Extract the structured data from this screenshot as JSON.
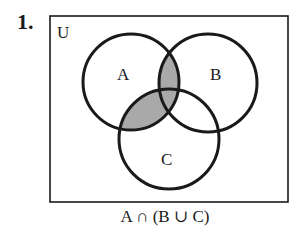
{
  "problem": {
    "number": "1."
  },
  "diagram": {
    "universe_label": "U",
    "sets": [
      {
        "label": "A",
        "cx": 131,
        "cy": 82,
        "r": 48
      },
      {
        "label": "B",
        "cx": 208,
        "cy": 83,
        "r": 49
      },
      {
        "label": "C",
        "cx": 169,
        "cy": 139,
        "r": 50
      }
    ],
    "shaded_region": "A ∩ (B ∪ C)",
    "shade_color": "#a9a9a9",
    "line_color": "#1a1a1a"
  },
  "caption": {
    "text": "A ∩ (B ∪ C)"
  }
}
